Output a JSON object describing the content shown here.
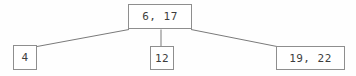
{
  "diagram": {
    "type": "b-tree",
    "title": "",
    "background_color": "#fefefe",
    "border_color": "#8e8e8e",
    "text_color": "#3d3d3d",
    "edge_color": "#7a7a7a",
    "root": {
      "label": "6, 17",
      "keys": [
        6,
        17
      ]
    },
    "children": [
      {
        "label": "4",
        "keys": [
          4
        ]
      },
      {
        "label": "12",
        "keys": [
          12
        ]
      },
      {
        "label": "19, 22",
        "keys": [
          19,
          22
        ]
      }
    ],
    "edges": [
      {
        "from": "root",
        "to": "child-0"
      },
      {
        "from": "root",
        "to": "child-1"
      },
      {
        "from": "root",
        "to": "child-2"
      }
    ]
  }
}
